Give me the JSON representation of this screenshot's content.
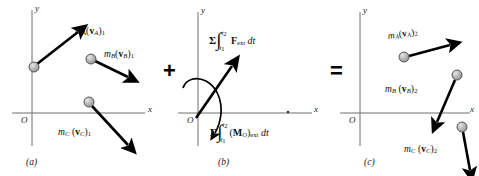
{
  "figure": {
    "type": "principle-of-impulse-and-momentum-diagram",
    "operators": {
      "plus": "+",
      "equals": "="
    },
    "colors": {
      "axis": "#6f6f6f",
      "vector": "#000000",
      "particle_fill": "#b8b8b8",
      "particle_stroke": "#4a4a4a",
      "text": "#111111"
    }
  },
  "panels": [
    {
      "id": "a",
      "caption": "(a)",
      "axes": {
        "x_label": "x",
        "y_label": "y",
        "origin_label": "O"
      },
      "particles": [
        {
          "name": "A",
          "label_parts": {
            "m": "m",
            "m_sub": "A",
            "open": "(",
            "v": "v",
            "v_sub": "A",
            "close": ")",
            "state": "1"
          },
          "label_text": "mA(vA)1"
        },
        {
          "name": "B",
          "label_parts": {
            "m": "m",
            "m_sub": "B",
            "open": "(",
            "v": "v",
            "v_sub": "B",
            "close": ")",
            "state": "1"
          },
          "label_text": "mB(vB)1"
        },
        {
          "name": "C",
          "label_parts": {
            "m": "m",
            "m_sub": "C",
            "open": "(",
            "v": "v",
            "v_sub": "C",
            "close": ")",
            "state": "1"
          },
          "label_text": "mC(vC)1"
        }
      ]
    },
    {
      "id": "b",
      "caption": "(b)",
      "axes": {
        "x_label": "x",
        "y_label": "y",
        "origin_label": "O"
      },
      "terms": [
        {
          "name": "linear-impulse",
          "sigma": "Σ",
          "integral": "∫",
          "lower_limit": "t",
          "lower_limit_sub": "1",
          "upper_limit": "t",
          "upper_limit_sub": "2",
          "integrand": "F",
          "integrand_sub": "ext",
          "differential": "dt",
          "text": "Σ∫(t1,t2) Fext dt"
        },
        {
          "name": "angular-impulse",
          "sigma": "Σ",
          "integral": "∫",
          "lower_limit": "t",
          "lower_limit_sub": "1",
          "upper_limit": "t",
          "upper_limit_sub": "2",
          "integrand_open": "(",
          "integrand": "M",
          "integrand_point_sub": "O",
          "integrand_close": ")",
          "integrand_sub": "ext",
          "differential": "dt",
          "text": "Σ∫(t1,t2) (MO)ext dt"
        }
      ]
    },
    {
      "id": "c",
      "caption": "(c)",
      "axes": {
        "x_label": "x",
        "y_label": "y",
        "origin_label": "O"
      },
      "particles": [
        {
          "name": "A",
          "label_parts": {
            "m": "m",
            "m_sub": "A",
            "open": "(",
            "v": "v",
            "v_sub": "A",
            "close": ")",
            "state": "2"
          },
          "label_text": "mA(vA)2"
        },
        {
          "name": "B",
          "label_parts": {
            "m": "m",
            "m_sub": "B",
            "open": "(",
            "v": "v",
            "v_sub": "B",
            "close": ")",
            "state": "2"
          },
          "label_text": "mB(vB)2"
        },
        {
          "name": "C",
          "label_parts": {
            "m": "m",
            "m_sub": "C",
            "open": "(",
            "v": "v",
            "v_sub": "C",
            "close": ")",
            "state": "2"
          },
          "label_text": "mC(vC)2"
        }
      ]
    }
  ]
}
